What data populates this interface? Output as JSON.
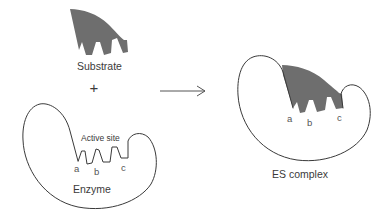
{
  "diagram": {
    "left_panel": {
      "substrate_label": "Substrate",
      "plus_sign": "+",
      "enzyme_label": "Enzyme",
      "active_site_label": "Active site",
      "site_letters": [
        "a",
        "b",
        "c"
      ]
    },
    "arrow": {
      "direction": "right"
    },
    "right_panel": {
      "complex_label": "ES complex",
      "site_letters": [
        "a",
        "b",
        "c"
      ]
    },
    "colors": {
      "substrate_fill": "#6e6e6e",
      "outline": "#3a3a3a",
      "background": "#ffffff"
    }
  }
}
